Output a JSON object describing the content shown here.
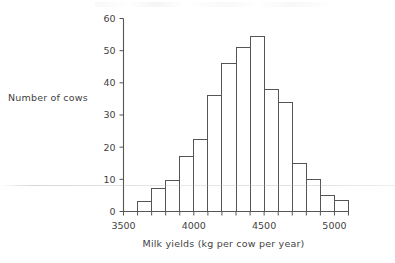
{
  "figure": {
    "name": "milk-yield-histogram",
    "background_color": "#ffffff",
    "line_color": "#555555",
    "text_color": "#3f3f3f"
  },
  "labels": {
    "y_axis_label": "Number of cows",
    "x_axis_label": "Milk yields (kg per cow per year)"
  },
  "chart_data": {
    "type": "bar",
    "title": "",
    "xlabel": "Milk yields (kg per cow per year)",
    "ylabel": "Number of cows",
    "xlim": [
      3500,
      5100
    ],
    "ylim": [
      0,
      60
    ],
    "grid": false,
    "legend": null,
    "bin_width": 100,
    "x_tick_labels": [
      "3500",
      "4000",
      "4500",
      "5000"
    ],
    "x_tick_values": [
      3500,
      4000,
      4500,
      5000
    ],
    "x_minor_tick_values": [
      3500,
      3600,
      3700,
      3800,
      3900,
      4000,
      4100,
      4200,
      4300,
      4400,
      4500,
      4600,
      4700,
      4800,
      4900,
      5000,
      5100
    ],
    "y_tick_labels": [
      "0",
      "10",
      "20",
      "30",
      "40",
      "50",
      "60"
    ],
    "y_tick_values": [
      0,
      10,
      20,
      30,
      40,
      50,
      60
    ],
    "categories": [
      "3600-3700",
      "3700-3800",
      "3800-3900",
      "3900-4000",
      "4000-4100",
      "4100-4200",
      "4200-4300",
      "4300-4400",
      "4400-4500",
      "4500-4600",
      "4600-4700",
      "4700-4800",
      "4800-4900",
      "4900-5000",
      "5000-5100"
    ],
    "bin_starts": [
      3600,
      3700,
      3800,
      3900,
      4000,
      4100,
      4200,
      4300,
      4400,
      4500,
      4600,
      4700,
      4800,
      4900,
      5000
    ],
    "values": [
      3,
      7,
      9.5,
      17,
      22.5,
      36,
      46,
      51,
      54.5,
      38,
      34,
      15,
      10,
      5,
      3.5
    ]
  }
}
